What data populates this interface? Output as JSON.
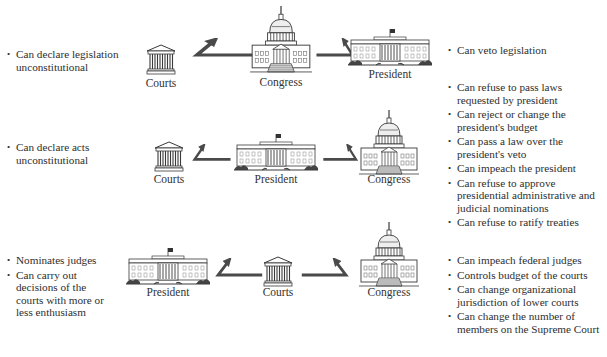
{
  "colors": {
    "text": "#333333",
    "arrow": "#4a4a4a",
    "building_stroke": "#3a3a3a",
    "background": "#ffffff"
  },
  "rows": [
    {
      "left_bullets": [
        "Can declare legislation unconstitutional"
      ],
      "nodes": [
        {
          "label": "Courts",
          "icon": "courthouse-icon"
        },
        {
          "label": "Congress",
          "icon": "capitol-icon"
        },
        {
          "label": "President",
          "icon": "white-house-icon"
        }
      ],
      "right_bullets": [
        "Can veto legislation"
      ]
    },
    {
      "left_bullets": [
        "Can declare acts unconstitutional"
      ],
      "nodes": [
        {
          "label": "Courts",
          "icon": "courthouse-icon"
        },
        {
          "label": "President",
          "icon": "white-house-icon"
        },
        {
          "label": "Congress",
          "icon": "capitol-icon"
        }
      ],
      "right_bullets": [
        "Can refuse to pass laws requested by president",
        "Can reject or change the president's budget",
        "Can pass a law over the president's veto",
        "Can impeach the president",
        "Can refuse to approve presidential administrative and judicial nominations",
        "Can refuse to ratify treaties"
      ]
    },
    {
      "left_bullets": [
        "Nominates judges",
        "Can carry out decisions of the courts with more or less enthusiasm"
      ],
      "nodes": [
        {
          "label": "President",
          "icon": "white-house-icon"
        },
        {
          "label": "Courts",
          "icon": "courthouse-icon"
        },
        {
          "label": "Congress",
          "icon": "capitol-icon"
        }
      ],
      "right_bullets": [
        "Can impeach federal judges",
        "Controls budget of the courts",
        "Can change organizational jurisdiction of lower courts",
        "Can change the number of members on the Supreme Court"
      ]
    }
  ]
}
